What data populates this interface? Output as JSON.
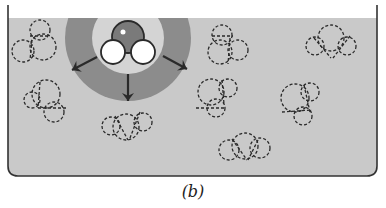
{
  "caption": "(b)",
  "colors": {
    "water": "#c9c9c9",
    "container_stroke": "#333333",
    "shell_outer": "#8c8c8c",
    "shell_inner": "#d4d4d4",
    "oxygen": "#7a7a7a",
    "hydrogen": "#ffffff",
    "molecule_outline": "#2a2a2a",
    "arrow": "#2a2a2a"
  },
  "container": {
    "left": 8,
    "right": 377,
    "top": 5,
    "water_level": 18,
    "bottom": 176,
    "corner_radius": 10
  },
  "hydration_shell": {
    "cx": 128,
    "cy": 38,
    "outer_r": 63,
    "inner_r": 36
  },
  "central_molecule": {
    "label": "water molecule",
    "oxygen": {
      "cx": 128,
      "cy": 37,
      "r": 16
    },
    "hydrogens": [
      {
        "cx": 113,
        "cy": 52,
        "r": 12
      },
      {
        "cx": 143,
        "cy": 52,
        "r": 12
      }
    ]
  },
  "arrows": [
    {
      "x1": 97,
      "y1": 57,
      "x2": 72,
      "y2": 70
    },
    {
      "x1": 128,
      "y1": 74,
      "x2": 128,
      "y2": 101
    },
    {
      "x1": 163,
      "y1": 56,
      "x2": 187,
      "y2": 69
    }
  ],
  "dashed_molecules": [
    {
      "circles": [
        [
          40,
          30,
          10
        ],
        [
          43,
          47,
          13
        ],
        [
          23,
          51,
          11
        ]
      ],
      "lines": [
        [
          30,
          36,
          50,
          36
        ],
        [
          32,
          40,
          30,
          60
        ]
      ]
    },
    {
      "circles": [
        [
          46,
          94,
          14
        ],
        [
          54,
          112,
          10
        ],
        [
          32,
          100,
          8
        ]
      ],
      "lines": [
        [
          40,
          82,
          38,
          108
        ],
        [
          38,
          108,
          66,
          108
        ]
      ]
    },
    {
      "circles": [
        [
          126,
          127,
          13
        ],
        [
          111,
          126,
          9
        ],
        [
          143,
          122,
          9
        ]
      ],
      "lines": [
        [
          115,
          116,
          128,
          140
        ],
        [
          140,
          112,
          130,
          138
        ]
      ]
    },
    {
      "circles": [
        [
          222,
          35,
          10
        ],
        [
          220,
          52,
          12
        ],
        [
          238,
          50,
          10
        ]
      ],
      "lines": [
        [
          212,
          36,
          233,
          36
        ],
        [
          230,
          38,
          228,
          64
        ]
      ]
    },
    {
      "circles": [
        [
          331,
          38,
          13
        ],
        [
          315,
          46,
          9
        ],
        [
          347,
          46,
          9
        ]
      ],
      "lines": [
        [
          314,
          38,
          331,
          58
        ],
        [
          350,
          36,
          333,
          58
        ]
      ]
    },
    {
      "circles": [
        [
          211,
          92,
          13
        ],
        [
          216,
          108,
          9
        ],
        [
          228,
          88,
          9
        ]
      ],
      "lines": [
        [
          222,
          80,
          224,
          104
        ],
        [
          196,
          108,
          226,
          108
        ]
      ]
    },
    {
      "circles": [
        [
          295,
          98,
          14
        ],
        [
          303,
          116,
          9
        ],
        [
          310,
          92,
          9
        ]
      ],
      "lines": [
        [
          304,
          85,
          310,
          112
        ],
        [
          282,
          112,
          312,
          110
        ]
      ]
    },
    {
      "circles": [
        [
          245,
          146,
          13
        ],
        [
          229,
          150,
          10
        ],
        [
          260,
          148,
          10
        ]
      ],
      "lines": [
        [
          232,
          139,
          247,
          160
        ],
        [
          258,
          140,
          248,
          160
        ]
      ]
    }
  ]
}
